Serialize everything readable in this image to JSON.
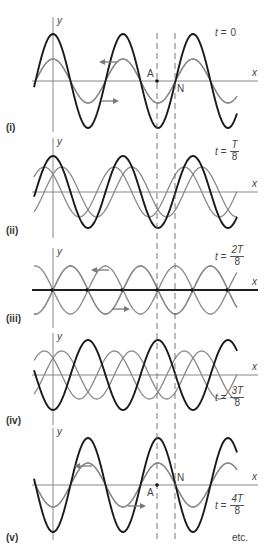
{
  "figure": {
    "axis_labels": {
      "x": "x",
      "y": "y"
    },
    "point_labels": {
      "antinode": "A",
      "node": "N"
    },
    "footer": "etc.",
    "colors": {
      "resultant": "#1a1a1a",
      "component": "#8a8a8a",
      "axis": "#7a7a7a"
    },
    "dashed_lines_x": [
      157,
      175
    ],
    "wavelength_px": 70
  },
  "panels": [
    {
      "id": "i",
      "label": "(i)",
      "time_prefix": "t = ",
      "time_num": "0",
      "time_den": "",
      "axis_y": 81,
      "y_top": 17,
      "y_bottom": 132,
      "gray_shifts": [
        0,
        0
      ],
      "gray_amp": 22,
      "black_amp": 47,
      "black_phase": 0,
      "label_y": 122,
      "time_x": 215,
      "time_y": 27,
      "arrows": [
        {
          "dir": "left",
          "x": 103,
          "y": 62
        },
        {
          "dir": "right",
          "x": 101,
          "y": 101
        }
      ],
      "show_A": true,
      "show_N": true,
      "A_pos": "top",
      "N_pos": "bottom"
    },
    {
      "id": "ii",
      "label": "(ii)",
      "time_prefix": "t = ",
      "time_num": "T",
      "time_den": "8",
      "axis_y": 192,
      "y_top": 138,
      "y_bottom": 238,
      "gray_shifts": [
        -8.75,
        8.75
      ],
      "gray_amp": 25,
      "black_amp": 36,
      "black_phase": 0,
      "label_y": 225,
      "time_x": 215,
      "time_y": 140,
      "arrows": [],
      "show_A": false,
      "show_N": false
    },
    {
      "id": "iii",
      "label": "(iii)",
      "time_prefix": "t = ",
      "time_num": "2T",
      "time_den": "8",
      "axis_y": 290,
      "y_top": 248,
      "y_bottom": 328,
      "gray_shifts": [
        -17.5,
        17.5
      ],
      "gray_amp": 24,
      "black_amp": 0,
      "black_phase": 0,
      "label_y": 313,
      "time_x": 215,
      "time_y": 245,
      "arrows": [
        {
          "dir": "left",
          "x": 95,
          "y": 270
        },
        {
          "dir": "right",
          "x": 112,
          "y": 309
        }
      ],
      "show_A": false,
      "show_N": false
    },
    {
      "id": "iv",
      "label": "(iv)",
      "time_prefix": "t = ",
      "time_num": "3T",
      "time_den": "8",
      "axis_y": 375,
      "y_top": 333,
      "y_bottom": 425,
      "gray_shifts": [
        -26.25,
        26.25
      ],
      "gray_amp": 24,
      "black_amp": 35,
      "black_phase": 1,
      "label_y": 415,
      "time_x": 215,
      "time_y": 386,
      "arrows": [],
      "show_A": false,
      "show_N": false
    },
    {
      "id": "v",
      "label": "(v)",
      "time_prefix": "t = ",
      "time_num": "4T",
      "time_den": "8",
      "axis_y": 485,
      "y_top": 428,
      "y_bottom": 540,
      "gray_shifts": [
        0,
        0
      ],
      "gray_amp": 22,
      "black_amp": 47,
      "black_phase": 1,
      "label_y": 532,
      "time_x": 215,
      "time_y": 494,
      "arrows": [
        {
          "dir": "left",
          "x": 78,
          "y": 466
        },
        {
          "dir": "right",
          "x": 128,
          "y": 506
        }
      ],
      "show_A": true,
      "show_N": true,
      "A_pos": "bottom",
      "N_pos": "top"
    }
  ]
}
